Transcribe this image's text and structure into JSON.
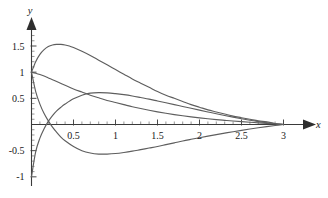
{
  "chart_data": {
    "type": "line",
    "title": "",
    "xlabel": "x",
    "ylabel": "y",
    "xlim": [
      0,
      3.05
    ],
    "ylim": [
      -1.05,
      1.75
    ],
    "grid": false,
    "legend": "none",
    "x_ticks": [
      {
        "value": 0.5,
        "label": "0.5"
      },
      {
        "value": 1,
        "label": "1"
      },
      {
        "value": 1.5,
        "label": "1.5"
      },
      {
        "value": 2,
        "label": "2"
      },
      {
        "value": 2.5,
        "label": "2.5"
      },
      {
        "value": 3,
        "label": "3"
      }
    ],
    "y_ticks": [
      {
        "value": 1.5,
        "label": "1.5"
      },
      {
        "value": 1,
        "label": "1"
      },
      {
        "value": 0.5,
        "label": "0.5"
      },
      {
        "value": -0.5,
        "label": "-0.5"
      },
      {
        "value": -1,
        "label": "-1"
      }
    ],
    "x_minor_step": 0.1,
    "y_minor_step": 0.1,
    "curve_color": "#5e5e5e",
    "axis_color": "#3a3a3a",
    "series": [
      {
        "name": "curve-1",
        "x": [
          0,
          0.05,
          0.1,
          0.15,
          0.2,
          0.25,
          0.3,
          0.35,
          0.4,
          0.45,
          0.5,
          0.6,
          0.7,
          0.8,
          0.9,
          1.0,
          1.1,
          1.2,
          1.3,
          1.4,
          1.5,
          1.6,
          1.7,
          1.8,
          1.9,
          2.0,
          2.1,
          2.2,
          2.3,
          2.4,
          2.5,
          2.6,
          2.7,
          2.8,
          2.9,
          3.0
        ],
        "y": [
          1.0,
          1.2,
          1.34,
          1.43,
          1.49,
          1.52,
          1.53,
          1.53,
          1.52,
          1.5,
          1.47,
          1.4,
          1.32,
          1.23,
          1.14,
          1.05,
          0.96,
          0.87,
          0.79,
          0.71,
          0.63,
          0.56,
          0.5,
          0.44,
          0.38,
          0.33,
          0.28,
          0.24,
          0.2,
          0.16,
          0.13,
          0.1,
          0.07,
          0.05,
          0.02,
          0.0
        ]
      },
      {
        "name": "curve-2",
        "x": [
          0,
          0.05,
          0.1,
          0.15,
          0.2,
          0.25,
          0.3,
          0.4,
          0.5,
          0.6,
          0.7,
          0.8,
          0.9,
          1.0,
          1.1,
          1.2,
          1.3,
          1.4,
          1.5,
          1.6,
          1.7,
          1.8,
          1.9,
          2.0,
          2.1,
          2.2,
          2.3,
          2.4,
          2.5,
          2.6,
          2.7,
          2.8,
          2.9,
          3.0
        ],
        "y": [
          1.0,
          0.98,
          0.955,
          0.925,
          0.89,
          0.855,
          0.82,
          0.75,
          0.68,
          0.62,
          0.56,
          0.51,
          0.46,
          0.42,
          0.38,
          0.34,
          0.305,
          0.272,
          0.242,
          0.215,
          0.19,
          0.167,
          0.146,
          0.127,
          0.11,
          0.094,
          0.08,
          0.066,
          0.054,
          0.043,
          0.032,
          0.022,
          0.011,
          0.0
        ]
      },
      {
        "name": "curve-3",
        "x": [
          0,
          0.05,
          0.1,
          0.15,
          0.2,
          0.25,
          0.3,
          0.35,
          0.4,
          0.5,
          0.6,
          0.7,
          0.8,
          0.9,
          1.0,
          1.1,
          1.2,
          1.3,
          1.4,
          1.5,
          1.6,
          1.7,
          1.8,
          1.9,
          2.0,
          2.1,
          2.2,
          2.3,
          2.4,
          2.5,
          2.6,
          2.7,
          2.8,
          2.9,
          3.0
        ],
        "y": [
          -1.0,
          -0.52,
          -0.26,
          -0.08,
          0.06,
          0.17,
          0.26,
          0.33,
          0.39,
          0.49,
          0.56,
          0.6,
          0.61,
          0.605,
          0.59,
          0.57,
          0.545,
          0.515,
          0.485,
          0.45,
          0.415,
          0.38,
          0.345,
          0.31,
          0.275,
          0.24,
          0.205,
          0.172,
          0.14,
          0.11,
          0.082,
          0.056,
          0.034,
          0.015,
          0.0
        ]
      },
      {
        "name": "curve-4",
        "x": [
          0,
          0.05,
          0.1,
          0.15,
          0.2,
          0.25,
          0.3,
          0.35,
          0.4,
          0.5,
          0.6,
          0.7,
          0.8,
          0.9,
          1.0,
          1.1,
          1.2,
          1.3,
          1.4,
          1.5,
          1.6,
          1.7,
          1.8,
          1.9,
          2.0,
          2.1,
          2.2,
          2.3,
          2.4,
          2.5,
          2.6,
          2.7,
          2.8,
          2.9,
          3.0
        ],
        "y": [
          1.0,
          0.63,
          0.39,
          0.21,
          0.07,
          -0.05,
          -0.15,
          -0.24,
          -0.31,
          -0.42,
          -0.5,
          -0.545,
          -0.565,
          -0.565,
          -0.555,
          -0.535,
          -0.51,
          -0.48,
          -0.45,
          -0.42,
          -0.385,
          -0.35,
          -0.315,
          -0.283,
          -0.252,
          -0.222,
          -0.193,
          -0.165,
          -0.138,
          -0.112,
          -0.087,
          -0.063,
          -0.04,
          -0.019,
          0.0
        ]
      }
    ]
  }
}
